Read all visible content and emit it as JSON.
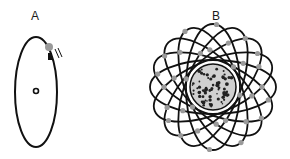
{
  "diagram": {
    "panels": [
      {
        "label": "A",
        "description": "Single electron orbiting a nucleus on an elliptical orbit",
        "orbit_count": 1,
        "electron_count": 1
      },
      {
        "label": "B",
        "description": "Many-electron atom with multiple elliptical orbits around a large nucleus",
        "orbit_count": 8,
        "electrons_per_orbit": 4
      }
    ],
    "colors": {
      "orbit": "#111111",
      "electron": "#9a9a9a",
      "nucleus_fill": "#d0d0d0",
      "nucleus_dots": "#222222"
    }
  }
}
